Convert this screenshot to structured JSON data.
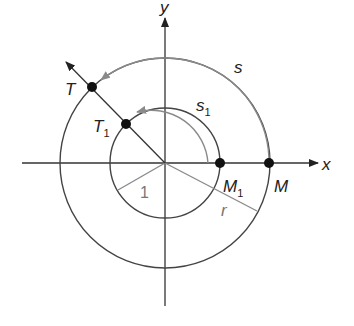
{
  "diagram": {
    "type": "unit-circle-arc-length",
    "axes": {
      "x_label": "x",
      "y_label": "y"
    },
    "points": [
      {
        "id": "T",
        "label": "T"
      },
      {
        "id": "T1",
        "label": "T",
        "subscript": "1"
      },
      {
        "id": "M",
        "label": "M"
      },
      {
        "id": "M1",
        "label": "M",
        "subscript": "1"
      }
    ],
    "arcs": [
      {
        "id": "s",
        "label": "s"
      },
      {
        "id": "s1",
        "label": "s",
        "subscript": "1"
      }
    ],
    "radii": [
      {
        "id": "unit",
        "label": "1"
      },
      {
        "id": "r",
        "label": "r"
      }
    ],
    "colors": {
      "line": "#333333",
      "gray": "#8a8a8a"
    }
  }
}
